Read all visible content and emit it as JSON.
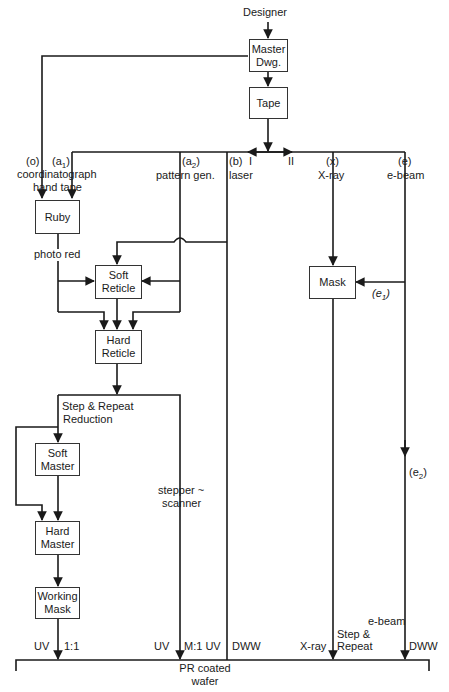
{
  "diagram": {
    "type": "flowchart",
    "top": {
      "source": "Designer",
      "boxes": [
        "Master Dwg.",
        "Tape"
      ]
    },
    "branches": {
      "o": {
        "tag": "(o)",
        "name": "coordinatograph"
      },
      "a1": {
        "tag": "(a1)",
        "tag_base": "(a",
        "tag_sub": "1",
        "tag_end": ")",
        "name": "hand tape"
      },
      "a2": {
        "tag": "(a2)",
        "tag_base": "(a",
        "tag_sub": "2",
        "tag_end": ")",
        "name": "pattern gen."
      },
      "b": {
        "tag": "(b)",
        "name": "laser"
      },
      "dir_I": "I",
      "dir_II": "II",
      "x": {
        "tag": "(x)",
        "name": "X-ray"
      },
      "e": {
        "tag": "(e)",
        "name": "e-beam"
      }
    },
    "boxes": {
      "ruby": "Ruby",
      "soft_reticle_1": "Soft",
      "soft_reticle_2": "Reticle",
      "hard_reticle_1": "Hard",
      "hard_reticle_2": "Reticle",
      "mask": "Mask",
      "soft_master_1": "Soft",
      "soft_master_2": "Master",
      "hard_master_1": "Hard",
      "hard_master_2": "Master",
      "working_mask_1": "Working",
      "working_mask_2": "Mask"
    },
    "labels": {
      "photo_red": "photo red",
      "step_repeat_1": "Step & Repeat",
      "step_repeat_2": "Reduction",
      "stepper_1": "stepper ~",
      "stepper_2": "scanner",
      "e1_base": "(e",
      "e1_sub": "1",
      "e1_end": ")",
      "e2_base": "(e",
      "e2_sub": "2",
      "e2_end": ")"
    },
    "bottom": {
      "uv_1": "UV",
      "ratio_1": "1:1",
      "uv_2": "UV",
      "ratio_m": "M:1 UV",
      "dww_1": "DWW",
      "xray": "X-ray",
      "step_1": "Step &",
      "step_2": "Repeat",
      "ebeam": "e-beam",
      "dww_2": "DWW",
      "target_1": "PR coated",
      "target_2": "wafer"
    }
  }
}
